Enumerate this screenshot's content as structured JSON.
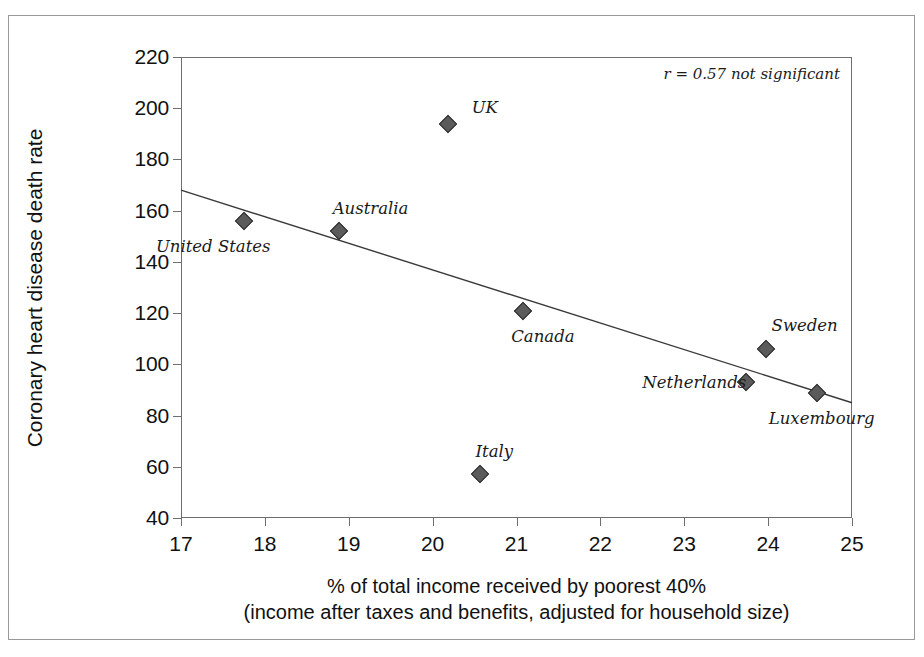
{
  "chart_data": {
    "type": "scatter",
    "title": "",
    "xlabel": "% of total income received by poorest 40%",
    "xlabel_line2": "(income after taxes and benefits, adjusted for household size)",
    "ylabel": "Coronary heart disease death rate",
    "xlim": [
      17,
      25
    ],
    "ylim": [
      40,
      220
    ],
    "xticks": [
      17,
      18,
      19,
      20,
      21,
      22,
      23,
      24,
      25
    ],
    "yticks": [
      40,
      60,
      80,
      100,
      120,
      140,
      160,
      180,
      200,
      220
    ],
    "grid": false,
    "legend": "none",
    "annotation": "r = 0.57 not significant",
    "marker_color": "#5b5b5b",
    "marker_edge_color": "#2f2f2f",
    "line_color": "#3a3a3a",
    "axis_color": "#6f6f6f",
    "points": [
      {
        "label": "United States",
        "x": 17.75,
        "y": 156,
        "label_dx": -88,
        "label_dy": 26
      },
      {
        "label": "Australia",
        "x": 18.88,
        "y": 152,
        "label_dx": -6,
        "label_dy": -22
      },
      {
        "label": "UK",
        "x": 20.18,
        "y": 194,
        "label_dx": 24,
        "label_dy": -16
      },
      {
        "label": "Canada",
        "x": 21.08,
        "y": 121,
        "label_dx": -12,
        "label_dy": 26
      },
      {
        "label": "Italy",
        "x": 20.56,
        "y": 57,
        "label_dx": -4,
        "label_dy": -22
      },
      {
        "label": "Netherlands",
        "x": 23.74,
        "y": 93,
        "label_dx": -104,
        "label_dy": 1
      },
      {
        "label": "Sweden",
        "x": 23.97,
        "y": 106,
        "label_dx": 6,
        "label_dy": -23
      },
      {
        "label": "Luxembourg",
        "x": 24.58,
        "y": 89,
        "label_dx": -48,
        "label_dy": 26
      }
    ],
    "trendline": {
      "x0": 17,
      "y0": 168,
      "x1": 25,
      "y1": 85
    }
  }
}
